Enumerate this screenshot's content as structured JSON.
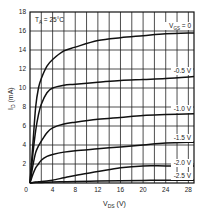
{
  "chart_data": {
    "type": "line",
    "title": "",
    "annotation": "T_A = 25°C",
    "xlabel": "V_DS (V)",
    "ylabel": "I_D (mA)",
    "xlim": [
      0,
      29
    ],
    "ylim": [
      0,
      18
    ],
    "xticks": [
      0,
      4,
      8,
      12,
      16,
      20,
      24,
      28
    ],
    "yticks": [
      2,
      4,
      6,
      8,
      10,
      12,
      14,
      16,
      18
    ],
    "grid": true,
    "legend_position": "inline-right",
    "x": [
      0,
      0.5,
      1,
      1.5,
      2,
      3,
      4,
      6,
      8,
      12,
      16,
      20,
      24,
      29
    ],
    "series": [
      {
        "name": "V_GS = 0",
        "label": "VGS = 0",
        "values": [
          0,
          4,
          8,
          10,
          11,
          12.3,
          13,
          13.9,
          14.3,
          15.0,
          15.3,
          15.5,
          15.7,
          15.8
        ]
      },
      {
        "name": "-0.5 V",
        "label": "-0.5 V",
        "values": [
          0,
          3,
          5.5,
          7.2,
          8.3,
          9.5,
          10.0,
          10.3,
          10.4,
          10.6,
          10.8,
          10.9,
          11.0,
          11.2
        ]
      },
      {
        "name": "-1.0 V",
        "label": "-1.0 V",
        "values": [
          0,
          1.8,
          3.2,
          3.9,
          4.4,
          5.3,
          5.8,
          6.2,
          6.4,
          6.7,
          6.9,
          7.1,
          7.2,
          7.3
        ]
      },
      {
        "name": "-1.5 V",
        "label": "-1.5 V",
        "values": [
          0,
          0.9,
          1.6,
          2.0,
          2.4,
          2.8,
          3.0,
          3.25,
          3.4,
          3.6,
          3.8,
          4.0,
          4.2,
          4.3
        ]
      },
      {
        "name": "-2.0 V",
        "label": "-2.0 V",
        "values": [
          0,
          0.05,
          0.1,
          0.12,
          0.15,
          0.22,
          0.3,
          0.55,
          0.8,
          1.2,
          1.6,
          1.8,
          1.8,
          1.8
        ]
      },
      {
        "name": "-2.5 V",
        "label": "-2.5 V",
        "values": [
          0,
          0.02,
          0.04,
          0.05,
          0.06,
          0.08,
          0.1,
          0.13,
          0.15,
          0.2,
          0.24,
          0.27,
          0.29,
          0.3
        ]
      }
    ]
  },
  "labels": {
    "ta": "T",
    "ta_sub": "A",
    "ta_rest": " = 25°C",
    "vgs": "V",
    "vgs_sub": "GS",
    "vgs_rest": " = 0",
    "xlabel_main": "V",
    "xlabel_sub": "DS",
    "xlabel_rest": " (V)",
    "ylabel_main": "I",
    "ylabel_sub": "D",
    "ylabel_rest": " (mA)",
    "zero": "0"
  }
}
